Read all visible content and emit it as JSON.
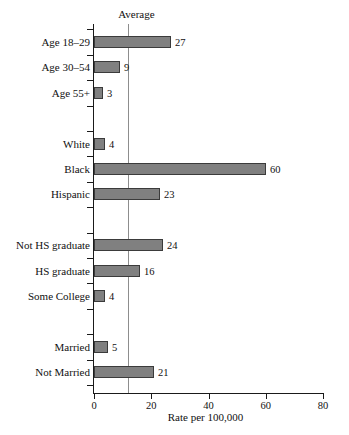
{
  "chart_data": {
    "type": "bar",
    "orientation": "horizontal",
    "title": "",
    "xlabel": "Rate per 100,000",
    "ylabel": "",
    "xlim": [
      0,
      80
    ],
    "xticks": [
      0,
      20,
      40,
      60,
      80
    ],
    "xtick_labels": [
      "0",
      "20",
      "40",
      "60",
      "80"
    ],
    "grid": false,
    "legend": "none",
    "bar_color": "#808080",
    "bar_edge_color": "#3b3b3b",
    "average_line": {
      "label": "Average",
      "value": 12,
      "color": "#8d8d8d"
    },
    "categories": [
      "Age 18–29",
      "Age 30–54",
      "Age 55+",
      "White",
      "Black",
      "Hispanic",
      "Not HS graduate",
      "HS graduate",
      "Some College",
      "Married",
      "Not Married"
    ],
    "values": [
      27,
      9,
      3,
      4,
      60,
      23,
      24,
      16,
      4,
      5,
      21
    ],
    "value_labels": [
      "27",
      "9",
      "3",
      "4",
      "60",
      "23",
      "24",
      "16",
      "4",
      "5",
      "21"
    ],
    "groups": [
      {
        "name": "Age",
        "categories": [
          "Age 18–29",
          "Age 30–54",
          "Age 55+"
        ]
      },
      {
        "name": "Race/Ethnicity",
        "categories": [
          "White",
          "Black",
          "Hispanic"
        ]
      },
      {
        "name": "Education",
        "categories": [
          "Not HS graduate",
          "HS graduate",
          "Some College"
        ]
      },
      {
        "name": "Marital Status",
        "categories": [
          "Married",
          "Not Married"
        ]
      }
    ],
    "bars": [
      {
        "label": "Age 18–29",
        "value": 27,
        "value_label": "27",
        "slot": 0
      },
      {
        "label": "Age 30–54",
        "value": 9,
        "value_label": "9",
        "slot": 1
      },
      {
        "label": "Age 55+",
        "value": 3,
        "value_label": "3",
        "slot": 2
      },
      {
        "label": "White",
        "value": 4,
        "value_label": "4",
        "slot": 4
      },
      {
        "label": "Black",
        "value": 60,
        "value_label": "60",
        "slot": 5
      },
      {
        "label": "Hispanic",
        "value": 23,
        "value_label": "23",
        "slot": 6
      },
      {
        "label": "Not HS graduate",
        "value": 24,
        "value_label": "24",
        "slot": 8
      },
      {
        "label": "HS graduate",
        "value": 16,
        "value_label": "16",
        "slot": 9
      },
      {
        "label": "Some College",
        "value": 4,
        "value_label": "4",
        "slot": 10
      },
      {
        "label": "Married",
        "value": 5,
        "value_label": "5",
        "slot": 12
      },
      {
        "label": "Not Married",
        "value": 21,
        "value_label": "21",
        "slot": 13
      }
    ]
  }
}
